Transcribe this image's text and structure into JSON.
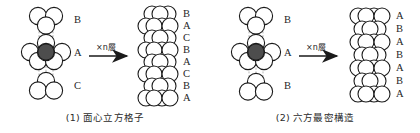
{
  "figure": {
    "title_alt": "close-packed structures comparison",
    "colors": {
      "stroke": "#1a1a1a",
      "highlight_fill": "#4d4d4d",
      "circle_fill": "#ffffff",
      "dashed_guide": "#9a9a9a",
      "text": "#1f1f1f"
    }
  },
  "panels": [
    {
      "id": "fcc",
      "caption": "(1) 面心立方格子",
      "arrow": {
        "multiplier": "×",
        "variable": "n",
        "unit": "層",
        "label": "×n層"
      },
      "left_cluster": {
        "layers": [
          {
            "label": "B",
            "role": "top-layer",
            "circles": 3,
            "orientation": "up-triangle"
          },
          {
            "label": "A",
            "role": "middle-layer",
            "circles": 7,
            "orientation": "hexagon-with-center",
            "center_shaded": true
          },
          {
            "label": "C",
            "role": "bottom-layer",
            "circles": 3,
            "orientation": "down-triangle"
          }
        ]
      },
      "stack": {
        "sequence": [
          "B",
          "A",
          "C",
          "B",
          "A",
          "C",
          "B",
          "A"
        ],
        "period": "ABCABC",
        "rows": 8
      }
    },
    {
      "id": "hcp",
      "caption": "(2) 六方最密構造",
      "arrow": {
        "multiplier": "×",
        "variable": "n",
        "unit": "層",
        "label": "×n層"
      },
      "left_cluster": {
        "layers": [
          {
            "label": "B",
            "role": "top-layer",
            "circles": 3,
            "orientation": "up-triangle"
          },
          {
            "label": "A",
            "role": "middle-layer",
            "circles": 7,
            "orientation": "hexagon-with-center",
            "center_shaded": true
          },
          {
            "label": "B",
            "role": "bottom-layer",
            "circles": 3,
            "orientation": "down-triangle"
          }
        ]
      },
      "stack": {
        "sequence": [
          "A",
          "B",
          "A",
          "B",
          "A",
          "B",
          "A"
        ],
        "period": "ABAB",
        "rows": 7
      }
    }
  ]
}
